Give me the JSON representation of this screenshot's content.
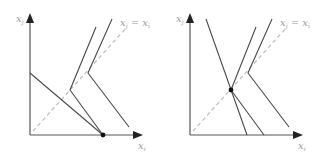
{
  "colors": {
    "axis": "#555555",
    "line": "#4a4a4a",
    "dashed": "#bdbdbd",
    "label": "#9a9a9a",
    "dot": "#111111"
  },
  "panels": [
    {
      "name": "left-panel",
      "y_axis_label": {
        "main": "x",
        "sub": "j"
      },
      "x_axis_label": {
        "main": "x",
        "sub": "i"
      },
      "diagonal_label": {
        "lhs": "x",
        "lhs_sub": "j",
        "eq": " = ",
        "rhs": "x",
        "rhs_sub": "i"
      },
      "axes": {
        "origin": [
          30,
          135
        ],
        "y_top": [
          30,
          15
        ],
        "x_right": [
          141,
          135
        ]
      },
      "diagonal": [
        [
          33,
          131
        ],
        [
          127,
          27
        ]
      ],
      "lines": [
        [
          [
            30,
            73
          ],
          [
            103,
            135
          ]
        ],
        [
          [
            96,
            27
          ],
          [
            70,
            90
          ],
          [
            103,
            135
          ]
        ],
        [
          [
            112,
            19
          ],
          [
            88,
            73
          ],
          [
            129,
            127
          ]
        ]
      ],
      "dot": [
        103,
        135
      ]
    },
    {
      "name": "right-panel",
      "y_axis_label": {
        "main": "x",
        "sub": "j"
      },
      "x_axis_label": {
        "main": "x",
        "sub": "i"
      },
      "diagonal_label": {
        "lhs": "x",
        "lhs_sub": "j",
        "eq": " = ",
        "rhs": "x",
        "rhs_sub": "i"
      },
      "axes": {
        "origin": [
          190,
          135
        ],
        "y_top": [
          190,
          15
        ],
        "x_right": [
          301,
          135
        ]
      },
      "diagonal": [
        [
          193,
          131
        ],
        [
          287,
          27
        ]
      ],
      "lines": [
        [
          [
            206,
            19
          ],
          [
            247,
            135
          ]
        ],
        [
          [
            256,
            27
          ],
          [
            231,
            90
          ],
          [
            264,
            135
          ]
        ],
        [
          [
            272,
            19
          ],
          [
            248,
            73
          ],
          [
            289,
            127
          ]
        ]
      ],
      "dot": [
        231,
        90
      ]
    }
  ]
}
